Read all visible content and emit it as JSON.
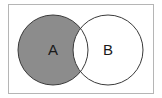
{
  "diagram": {
    "type": "venn",
    "shaded_region": "A minus B",
    "sets": [
      {
        "label": "A",
        "cx": 53,
        "cy": 50,
        "r": 35
      },
      {
        "label": "B",
        "cx": 108,
        "cy": 50,
        "r": 35
      }
    ],
    "colors": {
      "fill": "#8c8c8c",
      "stroke": "#3a3a3a",
      "frame": "#b5b5b5",
      "background": "#ffffff"
    }
  }
}
